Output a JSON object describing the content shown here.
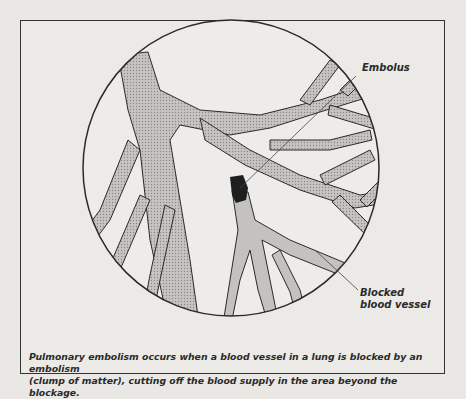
{
  "diagram": {
    "labels": {
      "embolus": "Embolus",
      "blocked_line1": "Blocked",
      "blocked_line2": "blood vessel"
    },
    "caption": {
      "line1": "Pulmonary embolism occurs when a blood vessel in a lung is blocked by an embolism",
      "line2": "(clump of matter), cutting off the blood supply in the area beyond the blockage."
    },
    "colors": {
      "background": "#e9e8e5",
      "vessel_fill": "#b9b8b5",
      "blocked_fill": "#c9c8c5",
      "embolus": "#1e1e1e",
      "outline": "#2a2a2a"
    }
  }
}
